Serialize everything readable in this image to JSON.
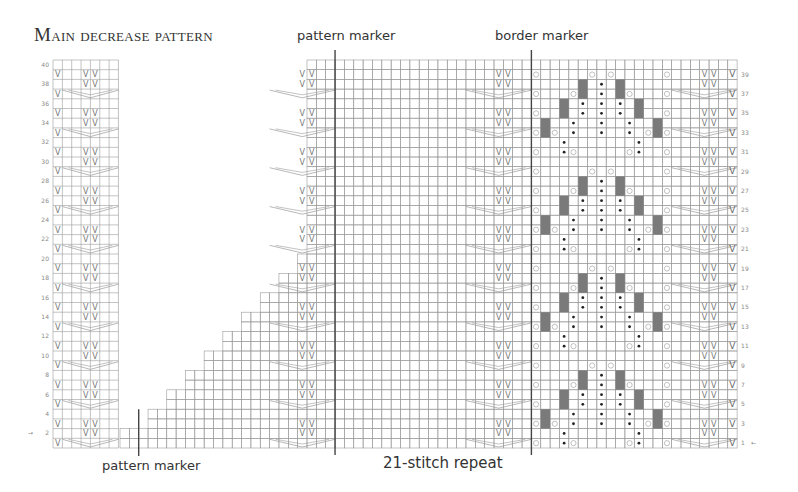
{
  "title": "Main decrease pattern",
  "labels": {
    "pattern_marker_top": "pattern marker",
    "border_marker": "border marker",
    "pattern_marker_bottom": "pattern marker",
    "repeat": "21-stitch repeat"
  },
  "grid": {
    "rows": 40,
    "left_panel_cols": 7,
    "main_cols": 66,
    "cell_w": 9.35,
    "cell_h": 9.7,
    "left_x": 53,
    "main_x": 120,
    "top_y": 60,
    "line_color": "#9a9a9a",
    "marker_color": "#444444",
    "fill_color": "#7a7a7a"
  },
  "row_numbers_left": [
    "40",
    "38",
    "36",
    "34",
    "32",
    "30",
    "28",
    "26",
    "24",
    "22",
    "20",
    "18",
    "16",
    "14",
    "12",
    "10",
    "8",
    "6",
    "4",
    "2"
  ],
  "row_numbers_right": [
    "39",
    "37",
    "35",
    "33",
    "31",
    "29",
    "27",
    "25",
    "23",
    "21",
    "19",
    "17",
    "15",
    "13",
    "11",
    "9",
    "7",
    "5",
    "3",
    "1"
  ],
  "start_arrows": {
    "left_row": "2",
    "right_row": "1"
  },
  "markers": {
    "pattern_marker_bottom_col": 2,
    "pattern_marker_top_col": 23,
    "border_marker_col": 44
  },
  "legend_symbols": [
    "slip-stitch-V",
    "yarn-over-O",
    "bobble-dot",
    "no-stitch-gray",
    "decrease-slant",
    "cable-chevron"
  ]
}
